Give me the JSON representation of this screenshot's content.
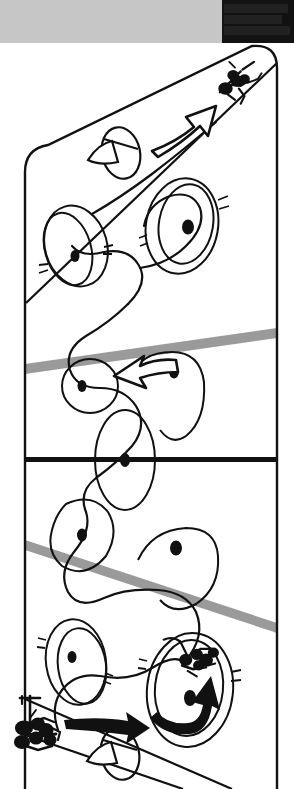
{
  "page": {
    "width": 294,
    "height": 789,
    "background": "#ffffff",
    "title": "BMX race track course diagram"
  },
  "header": {
    "gray_bar": {
      "color": "#c6c6c6",
      "label": ""
    },
    "dark_block": {
      "color": "#121212",
      "text_lines": [
        "",
        "",
        ""
      ],
      "note": "illegible degraded scan text"
    }
  },
  "colors": {
    "ink": "#111111",
    "paper": "#ffffff",
    "gray_band": "#9a9a9a",
    "header_gray": "#c6c6c6",
    "header_dark": "#121212"
  },
  "diagram": {
    "type": "track-course-illustration",
    "caption": "",
    "track_border": {
      "left_x": 25,
      "right_x": 277,
      "top_y": 47,
      "bottom_y": 789,
      "corner_radius": 22,
      "stroke_width": 2.2
    },
    "lanes": [
      {
        "name": "finish-straight",
        "kind": "diagonal-lane",
        "from": [
          25,
          300
        ],
        "to": [
          277,
          55
        ],
        "label": ""
      },
      {
        "name": "start-straight",
        "kind": "diagonal-lane",
        "from": [
          25,
          700
        ],
        "to": [
          230,
          789
        ],
        "label": ""
      }
    ],
    "rollers": [
      {
        "name": "roller-band-upper",
        "color": "#9a9a9a",
        "from": [
          25,
          369
        ],
        "to": [
          277,
          333
        ],
        "thickness": 11
      },
      {
        "name": "roller-band-lower",
        "color": "#9a9a9a",
        "from": [
          25,
          545
        ],
        "to": [
          277,
          628
        ],
        "thickness": 11
      }
    ],
    "straight_line": {
      "name": "finish-line",
      "color": "#111111",
      "y": 460,
      "from_x": 25,
      "to_x": 277,
      "thickness": 5
    },
    "berms": [
      {
        "id": 1,
        "cx": 76,
        "cy": 246,
        "rx": 31,
        "ry": 40,
        "rot": -18,
        "dot": [
          76,
          255
        ],
        "ticks": "left"
      },
      {
        "id": 2,
        "cx": 184,
        "cy": 225,
        "rx": 36,
        "ry": 47,
        "rot": 12,
        "dot": [
          188,
          222
        ],
        "ticks": "right"
      },
      {
        "id": 3,
        "cx": 88,
        "cy": 385,
        "rx": 28,
        "ry": 26,
        "rot": 0,
        "dot": [
          82,
          386
        ],
        "ticks": "none"
      },
      {
        "id": 4,
        "cx": 163,
        "cy": 382,
        "rx": 40,
        "ry": 34,
        "rot": 0,
        "dot": [
          174,
          372
        ],
        "ticks": "none"
      },
      {
        "id": 5,
        "cx": 125,
        "cy": 460,
        "rx": 30,
        "ry": 50,
        "rot": 0,
        "dot": [
          125,
          460
        ],
        "ticks": "none"
      },
      {
        "id": 6,
        "cx": 86,
        "cy": 540,
        "rx": 33,
        "ry": 43,
        "rot": 10,
        "dot": [
          82,
          535
        ],
        "ticks": "none"
      },
      {
        "id": 7,
        "cx": 180,
        "cy": 572,
        "rx": 40,
        "ry": 34,
        "rot": 8,
        "dot": [
          175,
          548
        ],
        "ticks": "none"
      },
      {
        "id": 8,
        "cx": 74,
        "cy": 662,
        "rx": 30,
        "ry": 42,
        "rot": -10,
        "dot": [
          71,
          655
        ],
        "ticks": "left"
      },
      {
        "id": 9,
        "cx": 190,
        "cy": 690,
        "rx": 42,
        "ry": 56,
        "rot": 8,
        "dot": [
          190,
          697
        ],
        "ticks": "right"
      }
    ],
    "riders": [
      {
        "name": "rider-finish",
        "position": [
          233,
          85
        ],
        "scale": 1.0,
        "description": "rider crossing finish at top right"
      },
      {
        "name": "rider-mid-course",
        "position": [
          186,
          660
        ],
        "scale": 0.95,
        "description": "rider carving the lower berm"
      },
      {
        "name": "rider-start-gate",
        "position": [
          34,
          718
        ],
        "scale": 1.0,
        "description": "rider at start gate bottom left"
      }
    ],
    "arrows": [
      {
        "name": "arrow-finish-hollow",
        "style": "hollow",
        "from": [
          152,
          147
        ],
        "to": [
          232,
          100
        ],
        "label": ""
      },
      {
        "name": "arrow-mid-hollow",
        "style": "hollow",
        "from": [
          172,
          363
        ],
        "to": [
          113,
          383
        ],
        "label": ""
      },
      {
        "name": "arrow-berm-solid",
        "style": "solid",
        "from": [
          190,
          700
        ],
        "to": [
          206,
          650
        ],
        "label": ""
      },
      {
        "name": "arrow-start-solid",
        "style": "solid",
        "from": [
          68,
          726
        ],
        "to": [
          148,
          729
        ],
        "label": ""
      }
    ],
    "jumps": [
      {
        "name": "jump-upper",
        "cx": 118,
        "cy": 153,
        "rx": 19,
        "ry": 25,
        "label": ""
      },
      {
        "name": "jump-lower",
        "cx": 118,
        "cy": 755,
        "rx": 19,
        "ry": 25,
        "label": ""
      }
    ],
    "racing_line": {
      "name": "racing-line-path",
      "stroke_width": 2.2,
      "description": "continuous serpentine line from start gate through all berms to finish"
    }
  }
}
